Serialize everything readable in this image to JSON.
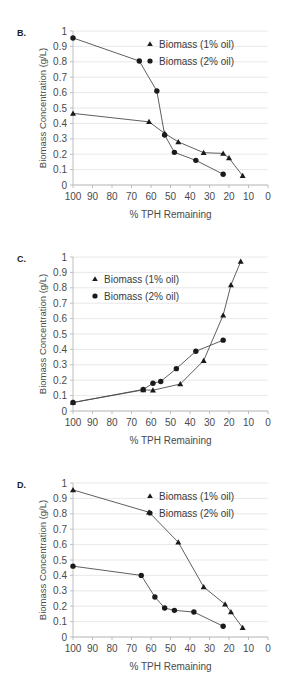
{
  "figure": {
    "background": "#ffffff",
    "marker_color": "#1a1a1a",
    "line_color": "#4d4d4d",
    "gridline_color": "#e2e2e2",
    "axis_color": "#b8b8b8"
  },
  "panels": [
    {
      "label": "B.",
      "legend_position": "top-right-inside",
      "chart_data": {
        "type": "scatter",
        "title": "",
        "xlabel": "% TPH Remaining",
        "ylabel": "Biomass Concentration (g/L)",
        "xlim": [
          100,
          0
        ],
        "ylim": [
          0,
          1
        ],
        "x_ticks": [
          100,
          90,
          80,
          70,
          60,
          50,
          40,
          30,
          20,
          10,
          0
        ],
        "y_ticks": [
          0,
          0.1,
          0.2,
          0.3,
          0.4,
          0.5,
          0.6,
          0.7,
          0.8,
          0.9,
          1
        ],
        "x_axis_reversed": true,
        "grid": true,
        "legend": [
          "Biomass (1% oil)",
          "Biomass (2% oil)"
        ],
        "series": [
          {
            "name": "Biomass (1% oil)",
            "marker": "triangle",
            "points": [
              {
                "x": 100,
                "y": 0.465
              },
              {
                "x": 61,
                "y": 0.41
              },
              {
                "x": 53,
                "y": 0.335
              },
              {
                "x": 46,
                "y": 0.28
              },
              {
                "x": 33,
                "y": 0.21
              },
              {
                "x": 23,
                "y": 0.205
              },
              {
                "x": 20,
                "y": 0.175
              },
              {
                "x": 13,
                "y": 0.06
              }
            ]
          },
          {
            "name": "Biomass (2% oil)",
            "marker": "circle",
            "points": [
              {
                "x": 100,
                "y": 0.955
              },
              {
                "x": 66,
                "y": 0.805
              },
              {
                "x": 57,
                "y": 0.61
              },
              {
                "x": 53,
                "y": 0.325
              },
              {
                "x": 48,
                "y": 0.212
              },
              {
                "x": 37,
                "y": 0.16
              },
              {
                "x": 23,
                "y": 0.07
              }
            ]
          }
        ]
      }
    },
    {
      "label": "C.",
      "legend_position": "top-left-inside",
      "chart_data": {
        "type": "scatter",
        "title": "",
        "xlabel": "% TPH Remaining",
        "ylabel": "Biomass Concentration (g/L)",
        "xlim": [
          100,
          0
        ],
        "ylim": [
          0,
          1
        ],
        "x_ticks": [
          100,
          90,
          80,
          70,
          60,
          50,
          40,
          30,
          20,
          10,
          0
        ],
        "y_ticks": [
          0,
          0.1,
          0.2,
          0.3,
          0.4,
          0.5,
          0.6,
          0.7,
          0.8,
          0.9,
          1
        ],
        "x_axis_reversed": true,
        "grid": true,
        "legend": [
          "Biomass (1% oil)",
          "Biomass (2% oil)"
        ],
        "series": [
          {
            "name": "Biomass (1% oil)",
            "marker": "triangle",
            "points": [
              {
                "x": 100,
                "y": 0.055
              },
              {
                "x": 64,
                "y": 0.137
              },
              {
                "x": 59,
                "y": 0.135
              },
              {
                "x": 45,
                "y": 0.175
              },
              {
                "x": 33,
                "y": 0.327
              },
              {
                "x": 23,
                "y": 0.622
              },
              {
                "x": 19,
                "y": 0.818
              },
              {
                "x": 14,
                "y": 0.97
              }
            ]
          },
          {
            "name": "Biomass (2% oil)",
            "marker": "circle",
            "points": [
              {
                "x": 100,
                "y": 0.055
              },
              {
                "x": 64,
                "y": 0.14
              },
              {
                "x": 59,
                "y": 0.18
              },
              {
                "x": 55,
                "y": 0.192
              },
              {
                "x": 47,
                "y": 0.275
              },
              {
                "x": 37,
                "y": 0.388
              },
              {
                "x": 23,
                "y": 0.46
              }
            ]
          }
        ]
      }
    },
    {
      "label": "D.",
      "legend_position": "top-right-inside",
      "chart_data": {
        "type": "scatter",
        "title": "",
        "xlabel": "% TPH Remaining",
        "ylabel": "Biomass Concentration (g/L)",
        "xlim": [
          100,
          0
        ],
        "ylim": [
          0,
          1
        ],
        "x_ticks": [
          100,
          90,
          80,
          70,
          60,
          50,
          40,
          30,
          20,
          10,
          0
        ],
        "y_ticks": [
          0,
          0.1,
          0.2,
          0.3,
          0.4,
          0.5,
          0.6,
          0.7,
          0.8,
          0.9,
          1
        ],
        "x_axis_reversed": true,
        "grid": true,
        "legend": [
          "Biomass (1% oil)",
          "Biomass (2% oil)"
        ],
        "series": [
          {
            "name": "Biomass (1% oil)",
            "marker": "triangle",
            "points": [
              {
                "x": 100,
                "y": 0.955
              },
              {
                "x": 61,
                "y": 0.81
              },
              {
                "x": 46,
                "y": 0.615
              },
              {
                "x": 33,
                "y": 0.325
              },
              {
                "x": 22,
                "y": 0.212
              },
              {
                "x": 19,
                "y": 0.163
              },
              {
                "x": 13,
                "y": 0.06
              }
            ]
          },
          {
            "name": "Biomass (2% oil)",
            "marker": "circle",
            "points": [
              {
                "x": 100,
                "y": 0.46
              },
              {
                "x": 65,
                "y": 0.4
              },
              {
                "x": 58,
                "y": 0.26
              },
              {
                "x": 53,
                "y": 0.188
              },
              {
                "x": 48,
                "y": 0.173
              },
              {
                "x": 38,
                "y": 0.162
              },
              {
                "x": 23,
                "y": 0.07
              }
            ]
          }
        ]
      }
    }
  ]
}
